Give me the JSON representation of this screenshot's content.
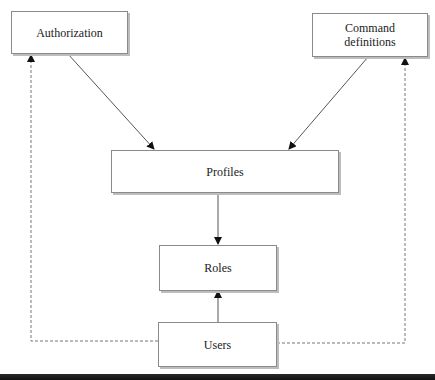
{
  "diagram": {
    "nodes": {
      "authorization": {
        "label": "Authorization"
      },
      "command_definitions": {
        "label": "Command definitions",
        "line1": "Command",
        "line2": "definitions"
      },
      "profiles": {
        "label": "Profiles"
      },
      "roles": {
        "label": "Roles"
      },
      "users": {
        "label": "Users"
      }
    },
    "edges": [
      {
        "from": "Authorization",
        "to": "Profiles",
        "style": "solid"
      },
      {
        "from": "Command definitions",
        "to": "Profiles",
        "style": "solid"
      },
      {
        "from": "Profiles",
        "to": "Roles",
        "style": "solid"
      },
      {
        "from": "Users",
        "to": "Roles",
        "style": "solid"
      },
      {
        "from": "Users",
        "to": "Authorization",
        "style": "dashed"
      },
      {
        "from": "Users",
        "to": "Command definitions",
        "style": "dashed"
      }
    ],
    "colors": {
      "line": "#555555",
      "border": "#8a8a8a",
      "text": "#1a1a1a"
    }
  }
}
